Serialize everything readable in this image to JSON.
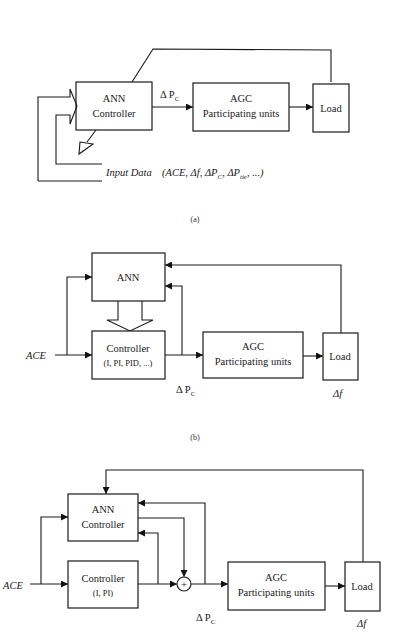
{
  "figure": {
    "panels": [
      {
        "id": "a",
        "caption": "(a)",
        "blocks": {
          "ann_controller": [
            "ANN",
            "Controller"
          ],
          "agc": [
            "AGC",
            "Participating units"
          ],
          "load": "Load"
        },
        "signals": {
          "controller_output": "Δ P",
          "controller_output_sub": "C",
          "input_data_label": "Input Data",
          "input_data_vars": "(ACE, Δf, ΔP",
          "input_data_sub_c": "C",
          "input_data_tie": ", ΔP",
          "input_data_sub_tie": "tie",
          "input_data_tail": ", ...)"
        }
      },
      {
        "id": "b",
        "caption": "(b)",
        "blocks": {
          "ann": "ANN",
          "controller": [
            "Controller",
            "(I, PI, PID, ...)"
          ],
          "agc": [
            "AGC",
            "Participating units"
          ],
          "load": "Load"
        },
        "signals": {
          "input": "ACE",
          "controller_output": "Δ P",
          "controller_output_sub": "C",
          "load_output": "Δf"
        }
      },
      {
        "id": "c",
        "caption": "",
        "blocks": {
          "ann_controller": [
            "ANN",
            "Controller"
          ],
          "controller": [
            "Controller",
            "(I, PI)"
          ],
          "summer": "+",
          "agc": [
            "AGC",
            "Participating units"
          ],
          "load": "Load"
        },
        "signals": {
          "input": "ACE",
          "controller_output": "Δ P",
          "controller_output_sub": "C",
          "load_output": "Δf"
        }
      }
    ]
  },
  "colors": {
    "line": "#1a1a1a",
    "background": "#ffffff"
  }
}
